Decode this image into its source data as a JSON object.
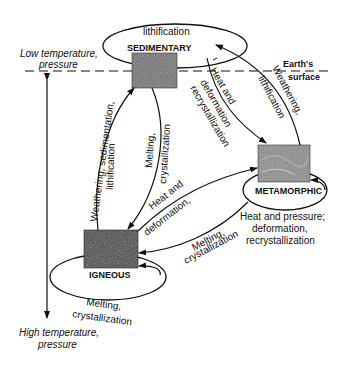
{
  "diagram": {
    "rocks": {
      "sedimentary": "SEDIMENTARY",
      "metamorphic": "METAMORPHIC",
      "igneous": "IGNEOUS"
    },
    "axis": {
      "top": [
        "Low temperature,",
        "pressure"
      ],
      "bottom": [
        "High temperature,",
        "pressure"
      ]
    },
    "surface": [
      "Earth's",
      "surface"
    ],
    "processes": {
      "sed_loop": "lithification",
      "sed_to_met": [
        "Heat and",
        "deformation",
        "recrystallization"
      ],
      "met_to_sed": [
        "Weathering,",
        "lithification"
      ],
      "ign_to_sed": [
        "Weathering, sedimentation,",
        "lithification"
      ],
      "sed_to_ign": [
        "Melting,",
        "crystallization"
      ],
      "ign_to_met": [
        "Heat and",
        "deformation,"
      ],
      "met_to_ign": [
        "Melting,",
        "crystallization"
      ],
      "met_loop": [
        "Heat and pressure;",
        "deformation,",
        "recrystallization"
      ],
      "ign_loop": [
        "Melting,",
        "crystallization"
      ]
    }
  }
}
